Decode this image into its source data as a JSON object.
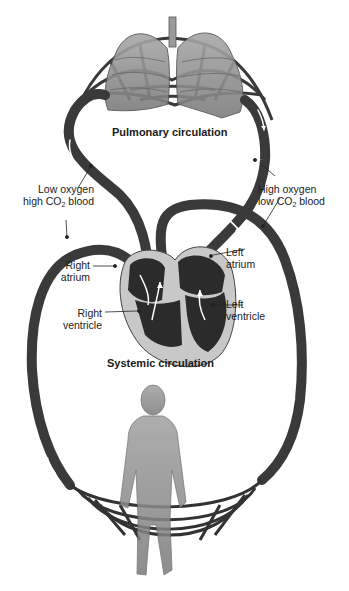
{
  "diagram": {
    "type": "circulatory-system",
    "sections": {
      "pulmonary": {
        "title": "Pulmonary circulation"
      },
      "systemic": {
        "title": "Systemic circulation"
      }
    },
    "labels": {
      "low_oxygen": {
        "line1": "Low oxygen",
        "line2_pre": "high CO",
        "line2_sub": "2",
        "line2_post": " blood"
      },
      "high_oxygen": {
        "line1": "High oxygen",
        "line2_pre": "low CO",
        "line2_sub": "2",
        "line2_post": " blood"
      },
      "right_atrium": {
        "line1": "Right",
        "line2": "atrium"
      },
      "right_ventricle": {
        "line1": "Right",
        "line2": "ventricle"
      },
      "left_atrium": {
        "line1": "Left",
        "line2": "atrium"
      },
      "left_ventricle": {
        "line1": "Left",
        "line2": "ventricle"
      }
    },
    "colors": {
      "vessel": "#3a3a3a",
      "heart_chamber": "#2b2b2b",
      "heart_wall": "#c8c8c8",
      "lung": "#8a8a8a",
      "body": "#9a9a9a",
      "arrow": "#ffffff"
    }
  }
}
